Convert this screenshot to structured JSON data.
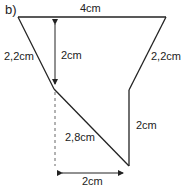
{
  "part_label": "b)",
  "labels": {
    "top": "4cm",
    "left_side": "2,2cm",
    "height": "2cm",
    "right_side": "2,2cm",
    "right_vertical": "2cm",
    "diagonal": "2,8cm",
    "bottom": "2cm"
  },
  "colors": {
    "line": "#222222",
    "dashed": "#666666"
  }
}
